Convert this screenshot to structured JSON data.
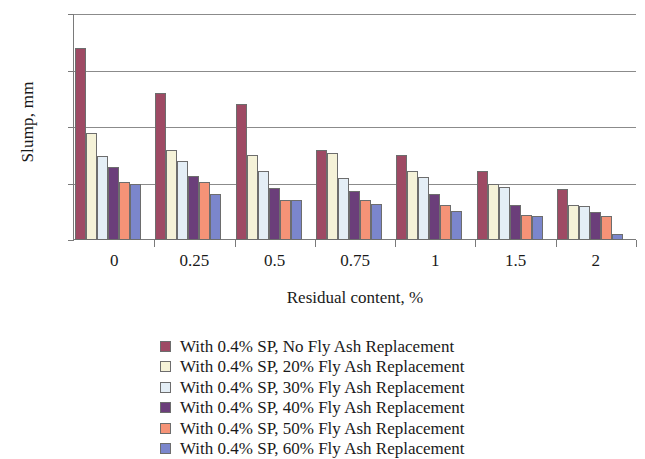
{
  "chart_data": {
    "type": "bar",
    "title": "",
    "xlabel": "Residual content, %",
    "ylabel": "Slump, mm",
    "categories": [
      "0",
      "0.25",
      "0.5",
      "0.75",
      "1",
      "1.5",
      "2"
    ],
    "ylim": [
      0,
      200
    ],
    "yticks": [
      0,
      50,
      100,
      150,
      200
    ],
    "grid": true,
    "legend_position": "bottom",
    "series": [
      {
        "name": "With 0.4% SP,  No Fly Ash Replacement",
        "color": "#9e4a64",
        "values": [
          170,
          130,
          120,
          80,
          75,
          61,
          45
        ]
      },
      {
        "name": "With 0.4% SP,  20% Fly Ash Replacement",
        "color": "#f5f2d8",
        "values": [
          95,
          80,
          75,
          77,
          61,
          50,
          31
        ]
      },
      {
        "name": "With 0.4% SP,  30% Fly Ash Replacement",
        "color": "#e4eef6",
        "values": [
          74,
          70,
          61,
          55,
          56,
          47,
          30
        ]
      },
      {
        "name": "With 0.4% SP,  40% Fly Ash Replacement",
        "color": "#6b3e7a",
        "values": [
          65,
          57,
          46,
          43,
          41,
          31,
          25
        ]
      },
      {
        "name": "With 0.4% SP,  50% Fly Ash Replacement",
        "color": "#f59377",
        "values": [
          51,
          51,
          35,
          35,
          31,
          22,
          21
        ]
      },
      {
        "name": "With 0.4% SP,  60% Fly Ash Replacement",
        "color": "#7b86cc",
        "values": [
          50,
          41,
          35,
          32,
          26,
          21,
          5
        ]
      }
    ]
  }
}
